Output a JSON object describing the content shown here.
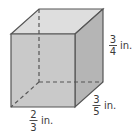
{
  "figure": {
    "type": "rectangular prism",
    "colors": {
      "front_face": "#c9c9c9",
      "top_face": "#dedede",
      "side_face": "#b5b5b5",
      "edge": "#555555",
      "hidden_edge": "#555555"
    },
    "dimensions": {
      "height": {
        "numerator": "3",
        "denominator": "4",
        "unit": "in."
      },
      "depth": {
        "numerator": "3",
        "denominator": "5",
        "unit": "in."
      },
      "width": {
        "numerator": "2",
        "denominator": "3",
        "unit": "in."
      }
    }
  }
}
